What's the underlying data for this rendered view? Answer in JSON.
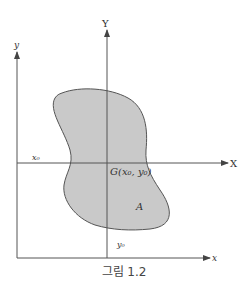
{
  "figure": {
    "caption": "그림 1.2",
    "axes": {
      "X_label": "X",
      "Y_label": "Y",
      "x_label": "x",
      "y_label": "y"
    },
    "labels": {
      "centroid": "G(x₀, y₀)",
      "area": "A",
      "x0": "x₀",
      "y0": "y₀"
    },
    "colors": {
      "shape_fill": "#c9c9c9",
      "stroke": "#555555"
    }
  }
}
